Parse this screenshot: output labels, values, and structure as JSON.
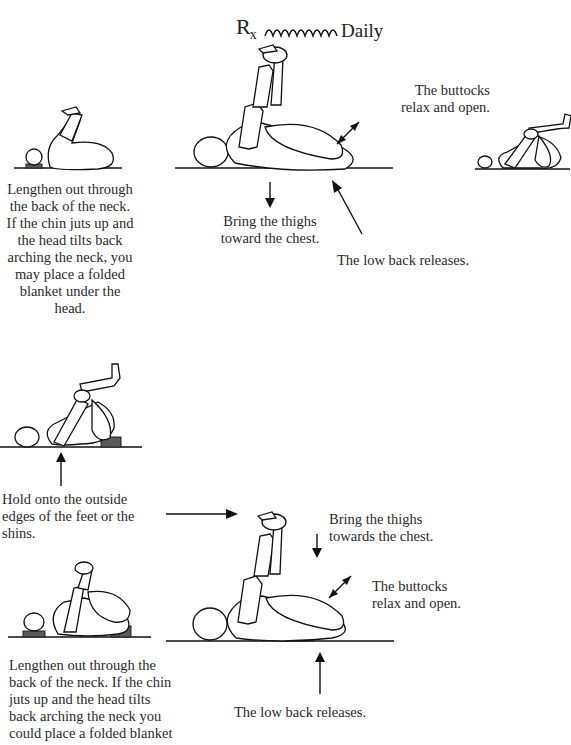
{
  "header": {
    "rx_symbol": "R",
    "rx_subscript": "x",
    "frequency": "Daily"
  },
  "top_section": {
    "left_caption": [
      "Lengthen out through",
      "the back of the neck.",
      "If the chin juts up and",
      "the head tilts back",
      "arching the neck, you",
      "may place a folded",
      "blanket under the",
      "head."
    ],
    "callout_buttocks": [
      "The buttocks",
      "relax and open."
    ],
    "callout_thighs": [
      "Bring the thighs",
      "toward the chest."
    ],
    "callout_low_back": "The low back releases."
  },
  "bottom_section": {
    "hold_caption": [
      "Hold onto the outside",
      "edges of the feet or the",
      "shins."
    ],
    "callout_thighs": [
      "Bring the thighs",
      "towards the chest."
    ],
    "callout_buttocks": [
      "The buttocks",
      "relax and open."
    ],
    "left_caption": [
      "Lengthen out through the",
      "back of the neck.  If the chin",
      "juts up and the head tilts",
      "back arching the neck you",
      "could place a folded blanket"
    ],
    "callout_low_back": "The low back releases."
  },
  "colors": {
    "ink": "#111111",
    "text": "#2a2a2a",
    "prop_block": "#5a5a5a",
    "background": "#ffffff"
  }
}
